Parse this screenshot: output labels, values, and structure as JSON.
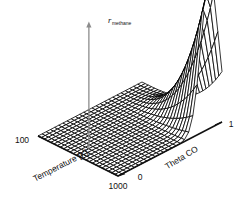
{
  "chart_data": {
    "type": "surface",
    "title": "",
    "xlabel": "Temperature [K]",
    "ylabel": "Theta CO",
    "zlabel": "r",
    "zlabel_sub": "methane",
    "xlim": [
      100,
      1000
    ],
    "ylim": [
      0,
      1
    ],
    "zlim": [
      0,
      1
    ],
    "grid": false,
    "legend": false,
    "xticks": [
      "100",
      "1000"
    ],
    "yticks": [
      "0",
      "1"
    ],
    "zticks": [],
    "nx": 26,
    "ny": 26,
    "peak": {
      "x": 1000,
      "y": 0.88,
      "z": 1.0
    },
    "surface_model": {
      "form": "z = exp(-((yn-0.88)/0.115)^2) * xn^3.1",
      "xn": "(T-100)/900",
      "yn": "ThetaCO"
    },
    "z_values_sample": {
      "note": "normalized z on a 6x6 subgrid, rows = Theta CO 0..1, cols = T 100..1000",
      "theta": [
        0.0,
        0.2,
        0.4,
        0.6,
        0.8,
        1.0
      ],
      "temperature": [
        100,
        280,
        460,
        640,
        820,
        1000
      ],
      "rows": [
        [
          0.0,
          0.0,
          0.0,
          0.0,
          0.0,
          0.0
        ],
        [
          0.0,
          0.0,
          0.0,
          0.0,
          0.0,
          0.0
        ],
        [
          0.0,
          0.0,
          0.0,
          0.0,
          0.001,
          0.001
        ],
        [
          0.0,
          0.0,
          0.001,
          0.004,
          0.011,
          0.024
        ],
        [
          0.0,
          0.002,
          0.017,
          0.06,
          0.151,
          0.312
        ],
        [
          0.0,
          0.002,
          0.018,
          0.063,
          0.158,
          0.327
        ]
      ]
    }
  },
  "axes": {
    "x_start_label": "100",
    "x_end_label": "1000",
    "x_title": "Temperature [K]",
    "y_start_label": "0",
    "y_end_label": "1",
    "y_title": "Theta CO",
    "z_title": "r",
    "z_title_sub": "methane"
  },
  "colors": {
    "mesh": "#000000",
    "axis": "#111111",
    "zaxis": "#8c8c8c",
    "background": "#ffffff"
  }
}
